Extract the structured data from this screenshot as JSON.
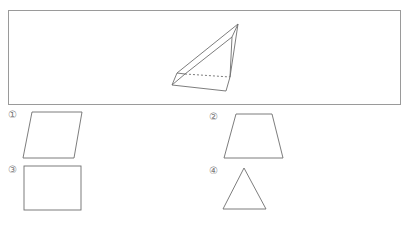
{
  "problem": {
    "figure": {
      "description": "triangular prism (3D solid) drawn in perspective with one hidden dashed edge"
    },
    "options": [
      {
        "label": "①",
        "shape": "parallelogram"
      },
      {
        "label": "②",
        "shape": "trapezoid"
      },
      {
        "label": "③",
        "shape": "rectangle"
      },
      {
        "label": "④",
        "shape": "triangle"
      }
    ],
    "colors": {
      "line": "#6e6e6e",
      "frame": "#9a9a9a",
      "label": "#777777"
    }
  }
}
